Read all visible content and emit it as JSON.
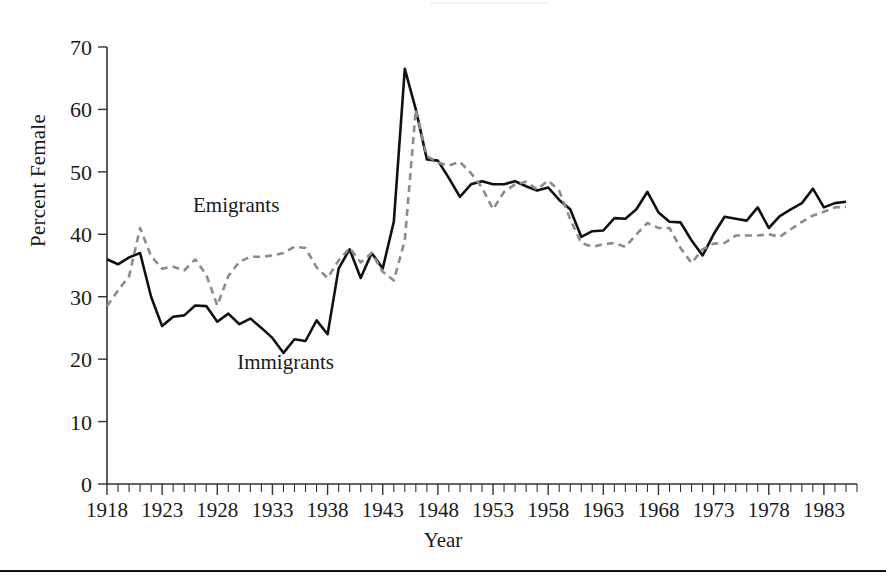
{
  "figure": {
    "axis_label_x": "Year",
    "axis_label_y": "Percent Female",
    "bottom_rule": true
  },
  "chart_data": {
    "type": "line",
    "title": "",
    "xlabel": "Year",
    "ylabel": "Percent Female",
    "xlim": [
      1918,
      1986
    ],
    "ylim": [
      0,
      70
    ],
    "yticks": [
      0,
      10,
      20,
      30,
      40,
      50,
      60,
      70
    ],
    "xticks": [
      1918,
      1923,
      1928,
      1933,
      1938,
      1943,
      1948,
      1953,
      1958,
      1963,
      1968,
      1973,
      1978,
      1983
    ],
    "xtick_step_minor": 1,
    "grid": false,
    "legend": "inline-annotations",
    "annotations": [
      {
        "text": "Emigrants",
        "x": 1925.8,
        "y": 43.5,
        "series": "emigrants"
      },
      {
        "text": "Immigrants",
        "x": 1929.8,
        "y": 18.5,
        "series": "immigrants"
      }
    ],
    "x": [
      1918,
      1919,
      1920,
      1921,
      1922,
      1923,
      1924,
      1925,
      1926,
      1927,
      1928,
      1929,
      1930,
      1931,
      1932,
      1933,
      1934,
      1935,
      1936,
      1937,
      1938,
      1939,
      1940,
      1941,
      1942,
      1943,
      1944,
      1945,
      1946,
      1947,
      1948,
      1949,
      1950,
      1951,
      1952,
      1953,
      1954,
      1955,
      1956,
      1957,
      1958,
      1959,
      1960,
      1961,
      1962,
      1963,
      1964,
      1965,
      1966,
      1967,
      1968,
      1969,
      1970,
      1971,
      1972,
      1973,
      1974,
      1975,
      1976,
      1977,
      1978,
      1979,
      1980,
      1981,
      1982,
      1983,
      1984,
      1985
    ],
    "series": [
      {
        "name": "Immigrants",
        "style": "solid",
        "color": "#111111",
        "values": [
          36.0,
          35.2,
          36.3,
          37.0,
          30.0,
          25.3,
          26.8,
          27.0,
          28.6,
          28.5,
          26.0,
          27.3,
          25.6,
          26.5,
          25.0,
          23.4,
          21.0,
          23.2,
          22.9,
          26.2,
          24.0,
          34.5,
          37.6,
          33.0,
          37.0,
          34.5,
          42.0,
          66.5,
          60.0,
          52.0,
          51.8,
          49.0,
          46.0,
          48.0,
          48.5,
          48.0,
          48.0,
          48.5,
          47.7,
          47.0,
          47.5,
          45.5,
          44.0,
          39.6,
          40.5,
          40.6,
          42.6,
          42.5,
          44.0,
          46.8,
          43.5,
          42.0,
          41.9,
          39.0,
          36.6,
          40.0,
          42.8,
          42.5,
          42.2,
          44.3,
          41.0,
          42.9,
          44.0,
          45.0,
          47.3,
          44.3,
          45.0,
          45.2
        ]
      },
      {
        "name": "Emigrants",
        "style": "dashed",
        "color": "#8c8c8c",
        "values": [
          28.5,
          31.0,
          33.3,
          41.0,
          36.5,
          34.5,
          34.8,
          34.2,
          36.0,
          33.5,
          28.6,
          33.3,
          35.6,
          36.4,
          36.4,
          36.6,
          37.0,
          38.0,
          37.8,
          34.7,
          33.0,
          35.8,
          37.8,
          35.5,
          37.0,
          34.0,
          32.6,
          39.0,
          60.0,
          52.5,
          51.5,
          51.0,
          51.6,
          49.8,
          47.5,
          44.0,
          46.8,
          48.0,
          48.4,
          47.2,
          48.6,
          47.0,
          42.4,
          38.6,
          38.0,
          38.4,
          38.6,
          38.0,
          40.0,
          41.8,
          41.0,
          41.0,
          37.8,
          35.4,
          37.6,
          38.5,
          38.6,
          39.8,
          39.8,
          39.8,
          40.0,
          39.6,
          40.8,
          42.0,
          43.0,
          43.6,
          44.3,
          44.4
        ]
      }
    ]
  }
}
